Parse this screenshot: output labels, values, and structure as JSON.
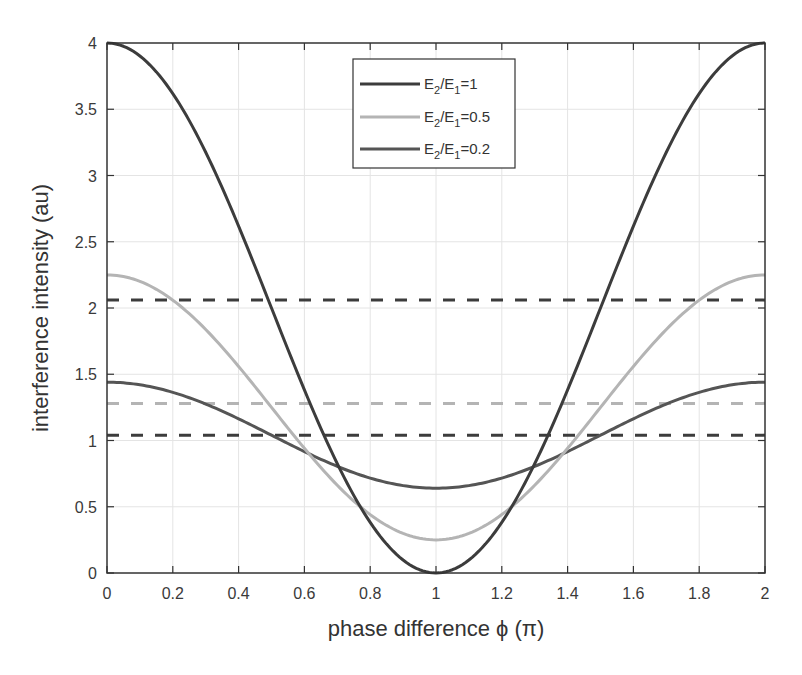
{
  "chart_data": {
    "type": "line",
    "title": "",
    "xlabel": "phase difference ϕ (π)",
    "ylabel": "interference intensity (au)",
    "xlim": [
      0,
      2
    ],
    "ylim": [
      0,
      4
    ],
    "xticks": [
      0,
      0.2,
      0.4,
      0.6,
      0.8,
      1,
      1.2,
      1.4,
      1.6,
      1.8,
      2
    ],
    "xtick_labels": [
      "0",
      "0.2",
      "0.4",
      "0.6",
      "0.8",
      "1",
      "1.2",
      "1.4",
      "1.6",
      "1.8",
      "2"
    ],
    "yticks": [
      0,
      0.5,
      1,
      1.5,
      2,
      2.5,
      3,
      3.5,
      4
    ],
    "ytick_labels": [
      "0",
      "0.5",
      "1",
      "1.5",
      "2",
      "2.5",
      "3",
      "3.5",
      "4"
    ],
    "grid": true,
    "legend_position": "upper center",
    "x": [
      0,
      0.1,
      0.2,
      0.3,
      0.4,
      0.5,
      0.6,
      0.7,
      0.8,
      0.9,
      1.0,
      1.1,
      1.2,
      1.3,
      1.4,
      1.5,
      1.6,
      1.7,
      1.8,
      1.9,
      2.0
    ],
    "series": [
      {
        "name": "E2/E1=1",
        "legend_main": "E",
        "legend_sub1": "2",
        "legend_mid": "/E",
        "legend_sub2": "1",
        "legend_tail": "=1",
        "color": "#3c3c3c",
        "ratio": 1,
        "values": [
          4.0,
          3.9,
          3.62,
          3.18,
          2.62,
          2.0,
          1.38,
          0.82,
          0.38,
          0.1,
          0.0,
          0.1,
          0.38,
          0.82,
          1.38,
          2.0,
          2.62,
          3.18,
          3.62,
          3.9,
          4.0
        ]
      },
      {
        "name": "E2/E1=0.5",
        "legend_main": "E",
        "legend_sub1": "2",
        "legend_mid": "/E",
        "legend_sub2": "1",
        "legend_tail": "=0.5",
        "color": "#b4b4b4",
        "ratio": 0.5,
        "values": [
          2.25,
          2.2,
          2.06,
          1.84,
          1.56,
          1.25,
          0.94,
          0.66,
          0.44,
          0.3,
          0.25,
          0.3,
          0.44,
          0.66,
          0.94,
          1.25,
          1.56,
          1.84,
          2.06,
          2.2,
          2.25
        ]
      },
      {
        "name": "E2/E1=0.2",
        "legend_main": "E",
        "legend_sub1": "2",
        "legend_mid": "/E",
        "legend_sub2": "1",
        "legend_tail": "=0.2",
        "color": "#555555",
        "ratio": 0.2,
        "values": [
          1.44,
          1.42,
          1.36,
          1.26,
          1.16,
          1.04,
          0.92,
          0.8,
          0.72,
          0.66,
          0.64,
          0.66,
          0.72,
          0.8,
          0.92,
          1.04,
          1.16,
          1.26,
          1.36,
          1.42,
          1.44
        ]
      }
    ],
    "reference_lines": [
      {
        "style": "dashed",
        "color": "#3c3c3c",
        "y": 2.06
      },
      {
        "style": "dashed",
        "color": "#b4b4b4",
        "y": 1.28
      },
      {
        "style": "dashed",
        "color": "#3c3c3c",
        "y": 1.04
      }
    ]
  }
}
